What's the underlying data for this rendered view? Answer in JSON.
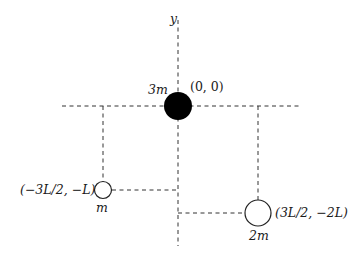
{
  "diagram": {
    "axis_label_y": "y",
    "origin_mass": {
      "mass_label": "3m",
      "coord_label": "(0, 0)",
      "fill": "#000000"
    },
    "left_mass": {
      "mass_label": "m",
      "coord_label": "(−3L/2, −L)"
    },
    "right_mass": {
      "mass_label": "2m",
      "coord_label": "(3L/2, −2L)"
    },
    "line_color": "#333333"
  }
}
